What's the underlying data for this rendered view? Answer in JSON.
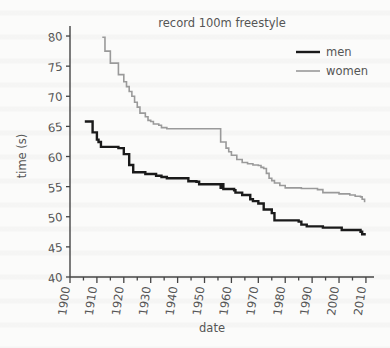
{
  "chart_data": {
    "type": "line",
    "title": "record 100m freestyle",
    "xlabel": "date",
    "ylabel": "time (s)",
    "xlim": [
      1900,
      2013
    ],
    "ylim": [
      40,
      81
    ],
    "xticks": [
      1900,
      1910,
      1920,
      1930,
      1940,
      1950,
      1960,
      1970,
      1980,
      1990,
      2000,
      2010
    ],
    "xticklabels": [
      "1900",
      "1910",
      "1920",
      "1930",
      "1940",
      "1950",
      "1960",
      "1970",
      "1980",
      "1990",
      "2000",
      "2010"
    ],
    "xminor_step": 5,
    "yticks": [
      40,
      45,
      50,
      55,
      60,
      65,
      70,
      75,
      80
    ],
    "yticklabels": [
      "40",
      "45",
      "50",
      "55",
      "60",
      "65",
      "70",
      "75",
      "80"
    ],
    "grid": false,
    "legend_position": "top-right",
    "drawstyle": "steps-post",
    "series": [
      {
        "name": "men",
        "color": "#1a1a1a",
        "linewidth": 2.4,
        "points": [
          [
            1905.5,
            65.8
          ],
          [
            1908.0,
            65.8
          ],
          [
            1908.4,
            64.0
          ],
          [
            1910.0,
            62.8
          ],
          [
            1910.6,
            62.4
          ],
          [
            1911.5,
            61.6
          ],
          [
            1912.0,
            61.6
          ],
          [
            1913.0,
            61.6
          ],
          [
            1918.0,
            61.4
          ],
          [
            1919.5,
            61.4
          ],
          [
            1920.0,
            60.4
          ],
          [
            1922.0,
            58.6
          ],
          [
            1922.6,
            58.6
          ],
          [
            1923.5,
            57.4
          ],
          [
            1924.0,
            57.4
          ],
          [
            1927.0,
            57.4
          ],
          [
            1928.0,
            57.1
          ],
          [
            1932.0,
            56.8
          ],
          [
            1934.0,
            56.6
          ],
          [
            1936.0,
            56.4
          ],
          [
            1938.0,
            56.4
          ],
          [
            1944.0,
            55.9
          ],
          [
            1947.0,
            55.8
          ],
          [
            1948.0,
            55.4
          ],
          [
            1952.0,
            55.4
          ],
          [
            1955.0,
            55.4
          ],
          [
            1956.0,
            54.8
          ],
          [
            1956.4,
            55.4
          ],
          [
            1957.0,
            54.6
          ],
          [
            1957.6,
            54.6
          ],
          [
            1961.0,
            54.4
          ],
          [
            1961.5,
            54.0
          ],
          [
            1964.0,
            53.6
          ],
          [
            1967.0,
            52.9
          ],
          [
            1968.0,
            52.6
          ],
          [
            1970.0,
            52.2
          ],
          [
            1972.0,
            51.2
          ],
          [
            1975.0,
            50.6
          ],
          [
            1975.6,
            50.6
          ],
          [
            1976.0,
            49.4
          ],
          [
            1981.0,
            49.4
          ],
          [
            1985.0,
            49.2
          ],
          [
            1986.0,
            48.7
          ],
          [
            1988.0,
            48.4
          ],
          [
            1994.0,
            48.2
          ],
          [
            2000.0,
            48.2
          ],
          [
            2001.0,
            47.8
          ],
          [
            2008.0,
            47.5
          ],
          [
            2008.6,
            47.1
          ],
          [
            2009.5,
            46.9
          ]
        ]
      },
      {
        "name": "women",
        "color": "#9a9a9a",
        "linewidth": 1.6,
        "points": [
          [
            1912.0,
            79.8
          ],
          [
            1913.0,
            77.5
          ],
          [
            1915.0,
            75.5
          ],
          [
            1918.0,
            73.6
          ],
          [
            1920.0,
            72.4
          ],
          [
            1921.0,
            71.6
          ],
          [
            1922.0,
            70.8
          ],
          [
            1923.0,
            70.0
          ],
          [
            1924.0,
            69.0
          ],
          [
            1925.0,
            68.2
          ],
          [
            1926.0,
            67.2
          ],
          [
            1928.0,
            66.6
          ],
          [
            1929.0,
            66.0
          ],
          [
            1930.0,
            65.8
          ],
          [
            1931.0,
            65.4
          ],
          [
            1933.0,
            65.2
          ],
          [
            1934.0,
            64.8
          ],
          [
            1936.0,
            64.6
          ],
          [
            1955.5,
            64.6
          ],
          [
            1956.0,
            62.4
          ],
          [
            1957.0,
            62.4
          ],
          [
            1958.0,
            61.4
          ],
          [
            1959.0,
            60.8
          ],
          [
            1960.0,
            60.2
          ],
          [
            1962.0,
            59.5
          ],
          [
            1964.0,
            59.0
          ],
          [
            1966.0,
            58.8
          ],
          [
            1968.0,
            58.6
          ],
          [
            1970.0,
            58.5
          ],
          [
            1971.0,
            58.2
          ],
          [
            1972.0,
            58.0
          ],
          [
            1973.0,
            57.2
          ],
          [
            1974.0,
            56.4
          ],
          [
            1975.0,
            56.0
          ],
          [
            1976.0,
            55.6
          ],
          [
            1978.0,
            55.2
          ],
          [
            1980.0,
            54.8
          ],
          [
            1984.0,
            54.8
          ],
          [
            1986.0,
            54.7
          ],
          [
            1992.0,
            54.5
          ],
          [
            1994.0,
            54.0
          ],
          [
            2000.0,
            53.8
          ],
          [
            2004.0,
            53.6
          ],
          [
            2006.0,
            53.4
          ],
          [
            2008.0,
            53.3
          ],
          [
            2008.6,
            52.9
          ],
          [
            2009.5,
            52.4
          ]
        ]
      }
    ]
  },
  "legend": {
    "items": [
      {
        "label": "men"
      },
      {
        "label": "women"
      }
    ]
  },
  "colors": {
    "men": "#1a1a1a",
    "women": "#9a9a9a",
    "axis": "#444444",
    "text": "#555555",
    "background": "#fbfbfa"
  }
}
